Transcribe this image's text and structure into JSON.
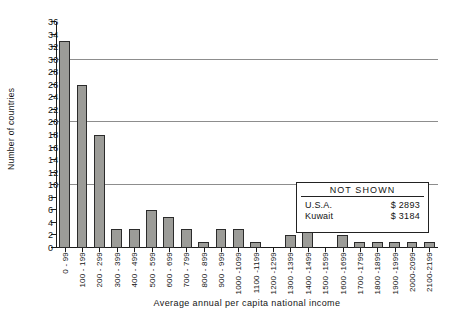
{
  "chart_data": {
    "type": "bar",
    "title": "",
    "xlabel": "Average annual per capita national income",
    "ylabel": "Number of countries",
    "ylim": [
      0,
      36
    ],
    "ytick_step": 2,
    "yticks": [
      0,
      2,
      4,
      6,
      8,
      10,
      12,
      14,
      16,
      18,
      20,
      22,
      24,
      26,
      28,
      30,
      32,
      34,
      36
    ],
    "gridlines": [
      10,
      20,
      30
    ],
    "grid": true,
    "legend_position": "inside-right",
    "categories": [
      "0 - 99",
      "100 - 199",
      "200 - 299",
      "300 - 399",
      "400 - 499",
      "500 - 599",
      "600 - 699",
      "700 - 799",
      "800 - 899",
      "900 - 999",
      "1000 -1099",
      "1100 -1199",
      "1200 -1299",
      "1300 -1399",
      "1400 -1499",
      "1500 -1599",
      "1600 -1699",
      "1700 -1799",
      "1800 -1899",
      "1900 -1999",
      "2000-2099",
      "2100-2199"
    ],
    "values": [
      33,
      26,
      18,
      3,
      3,
      6,
      5,
      3,
      1,
      3,
      3,
      1,
      0,
      2,
      7,
      0,
      2,
      1,
      1,
      1,
      1,
      1
    ],
    "bar_color": "#9c9c98",
    "bar_edge_color": "#2b2b2b",
    "annotation": {
      "title": "NOT SHOWN",
      "rows": [
        {
          "label": "U.S.A.",
          "amount": "$ 2893"
        },
        {
          "label": "Kuwait",
          "amount": "$ 3184"
        }
      ]
    }
  }
}
